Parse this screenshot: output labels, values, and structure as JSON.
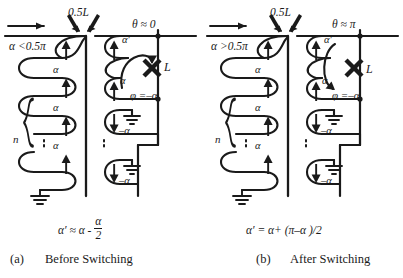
{
  "figure": {
    "type": "physics-schematic",
    "stroke_color": "#1a1a1a",
    "background": "#ffffff"
  },
  "panels": [
    {
      "id": "a",
      "caption_index": "(a)",
      "caption_text": "Before  Switching",
      "formula": {
        "lhs": "α′",
        "eq": "≈",
        "rhs_first": "α -",
        "frac_num": "α",
        "frac_den": "2"
      },
      "top_arrow": "feed-arrow-right",
      "half_wavelength_label": "0.5L",
      "input_condition": "α <0.5π",
      "theta_label": "θ ≈ 0",
      "load_label": "L",
      "phi_label": "φ =–α",
      "turns_label": "n",
      "left_loop_labels": [
        "α",
        "α",
        "α",
        "α"
      ],
      "right_upper_loop_labels": [
        "α′",
        "α"
      ],
      "right_lower_loop_labels": [
        "–α",
        "–α"
      ],
      "curved_arrow_direction": "clockwise-down",
      "ellipsis": "⋮"
    },
    {
      "id": "b",
      "caption_index": "(b)",
      "caption_text": "After  Switching",
      "formula_inline": "α′ = α+ (π–α )/2",
      "top_arrow": "feed-arrow-right",
      "half_wavelength_label": "0.5L",
      "input_condition": "α >0.5π",
      "theta_label": "θ ≈ π",
      "load_label": "L",
      "phi_label": "φ =–α",
      "turns_label": "n",
      "left_loop_labels": [
        "α",
        "α",
        "α",
        "α"
      ],
      "right_upper_loop_labels": [
        "α′",
        "α"
      ],
      "right_lower_loop_labels": [
        "–α",
        "–α"
      ],
      "curved_arrow_direction": "counterclockwise-up",
      "ellipsis": "⋮"
    }
  ]
}
